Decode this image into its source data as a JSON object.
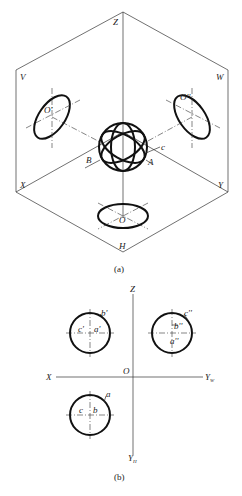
{
  "figure_a": {
    "caption": "(a)",
    "planes": {
      "V": "V",
      "W": "W",
      "H": "H"
    },
    "axes": {
      "Z": "Z",
      "X": "X",
      "Y": "Y"
    },
    "sphere_points": {
      "A": "A",
      "B": "B",
      "c": "c"
    },
    "projection_centers": {
      "front": "O'",
      "side": "O''",
      "top": "O"
    }
  },
  "figure_b": {
    "caption": "(b)",
    "axes": {
      "Z": "Z",
      "X": "X",
      "O": "O",
      "Yw": "Y",
      "Yw_sub": "W",
      "Yh": "Y",
      "Yh_sub": "H"
    },
    "front_view": {
      "a": "a'",
      "b": "b'",
      "c": "c'"
    },
    "side_view": {
      "a": "a''",
      "b": "b''",
      "c": "c''"
    },
    "top_view": {
      "a": "a",
      "b": "b",
      "c": "c"
    }
  }
}
